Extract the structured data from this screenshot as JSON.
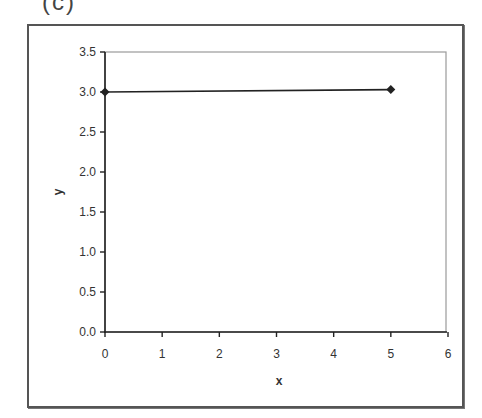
{
  "panel": {
    "label": "(c)"
  },
  "chart_data": {
    "type": "line",
    "title": "",
    "xlabel": "x",
    "ylabel": "y",
    "xlim": [
      0,
      6
    ],
    "ylim": [
      0,
      3.5
    ],
    "x_ticks": [
      "0",
      "1",
      "2",
      "3",
      "4",
      "5",
      "6"
    ],
    "y_ticks": [
      "0.0",
      "0.5",
      "1.0",
      "1.5",
      "2.0",
      "2.5",
      "3.0",
      "3.5"
    ],
    "grid": false,
    "legend": null,
    "marker": "diamond",
    "series": [
      {
        "name": "",
        "x": [
          0,
          5
        ],
        "y": [
          3.0,
          3.03
        ],
        "color": "#222222"
      }
    ]
  }
}
